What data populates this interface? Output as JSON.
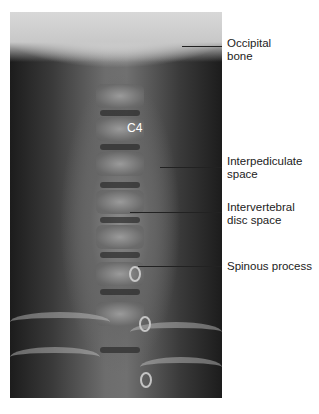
{
  "figure": {
    "vertebra_label": "C4",
    "labels": [
      {
        "id": "occipital-bone",
        "lines": [
          "Occipital",
          "bone"
        ]
      },
      {
        "id": "interpediculate-space",
        "lines": [
          "Interpediculate",
          "space"
        ]
      },
      {
        "id": "intervertebral-disc-space",
        "lines": [
          "Intervertebral",
          "disc space"
        ]
      },
      {
        "id": "spinous-process",
        "lines": [
          "Spinous process"
        ]
      }
    ]
  }
}
